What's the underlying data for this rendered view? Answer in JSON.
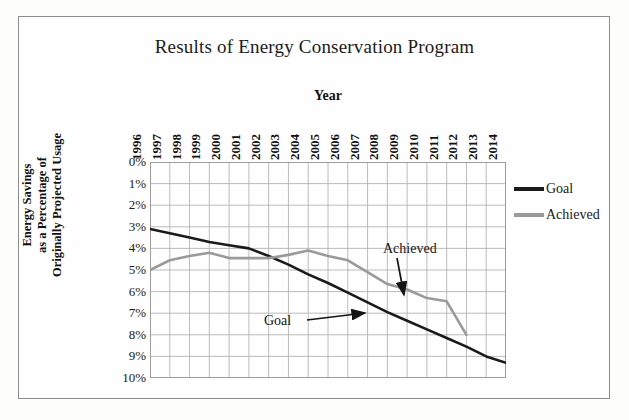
{
  "document": {
    "background_color": "#fdfdfb",
    "frame_color": "#8d8d8d"
  },
  "legend": {
    "position": "right",
    "items": [
      {
        "label": "Goal",
        "color": "#1a1a1a"
      },
      {
        "label": "Achieved",
        "color": "#9a9a9a"
      }
    ]
  },
  "annotations": [
    {
      "name": "goal",
      "label": "Goal"
    },
    {
      "name": "achieved",
      "label": "Achieved"
    }
  ],
  "chart_data": {
    "type": "line",
    "title": "Results of Energy Conservation Program",
    "xlabel": "Year",
    "ylabel": "Energy Savings as a Percentage of Originally Projected Usage",
    "ylabel_lines": [
      "Energy Savings",
      "as a Percentage of",
      "Originally Projected Usage"
    ],
    "x": [
      1996,
      1997,
      1998,
      1999,
      2000,
      2001,
      2002,
      2003,
      2004,
      2005,
      2006,
      2007,
      2008,
      2009,
      2010,
      2011,
      2012,
      2013,
      2014
    ],
    "categories": [
      "1996",
      "1997",
      "1998",
      "1999",
      "2000",
      "2001",
      "2002",
      "2003",
      "2004",
      "2005",
      "2006",
      "2007",
      "2008",
      "2009",
      "2010",
      "2011",
      "2012",
      "2013",
      "2014"
    ],
    "ytick_labels": [
      "0%",
      "1%",
      "2%",
      "3%",
      "4%",
      "5%",
      "6%",
      "7%",
      "8%",
      "9%",
      "10%"
    ],
    "ytick_values": [
      0,
      1,
      2,
      3,
      4,
      5,
      6,
      7,
      8,
      9,
      10
    ],
    "ylim": [
      0,
      10
    ],
    "y_axis_inverted": true,
    "grid": true,
    "series": [
      {
        "name": "Goal",
        "color": "#1a1a1a",
        "line_width": 2.6,
        "values": [
          3.1,
          3.3,
          3.5,
          3.7,
          3.85,
          4.0,
          4.35,
          4.75,
          5.2,
          5.6,
          6.05,
          6.5,
          6.95,
          7.35,
          7.75,
          8.15,
          8.55,
          9.0,
          9.3
        ]
      },
      {
        "name": "Achieved",
        "color": "#9a9a9a",
        "line_width": 2.6,
        "values": [
          5.0,
          4.55,
          4.35,
          4.2,
          4.45,
          4.45,
          4.45,
          4.3,
          4.1,
          4.35,
          4.55,
          5.1,
          5.65,
          5.9,
          6.3,
          6.45,
          8.0,
          null,
          null
        ]
      }
    ]
  }
}
